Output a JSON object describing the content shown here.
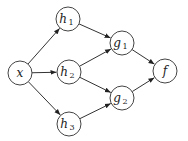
{
  "diagram": {
    "type": "directed-graph",
    "nodes": [
      {
        "id": "x",
        "label": "x",
        "sub": "",
        "cx": 20,
        "cy": 73
      },
      {
        "id": "h1",
        "label": "h",
        "sub": "1",
        "cx": 68,
        "cy": 19
      },
      {
        "id": "h2",
        "label": "h",
        "sub": "2",
        "cx": 69,
        "cy": 72
      },
      {
        "id": "h3",
        "label": "h",
        "sub": "3",
        "cx": 69,
        "cy": 124
      },
      {
        "id": "g1",
        "label": "g",
        "sub": "1",
        "cx": 122,
        "cy": 43
      },
      {
        "id": "g2",
        "label": "g",
        "sub": "2",
        "cx": 122,
        "cy": 98
      },
      {
        "id": "f",
        "label": "f",
        "sub": "",
        "cx": 165,
        "cy": 71
      }
    ],
    "edges": [
      {
        "from": "x",
        "to": "h1"
      },
      {
        "from": "x",
        "to": "h2"
      },
      {
        "from": "x",
        "to": "h3"
      },
      {
        "from": "h1",
        "to": "g1"
      },
      {
        "from": "h2",
        "to": "g1"
      },
      {
        "from": "h2",
        "to": "g2"
      },
      {
        "from": "h3",
        "to": "g2"
      },
      {
        "from": "g1",
        "to": "f"
      },
      {
        "from": "g2",
        "to": "f"
      }
    ],
    "node_radius": 12,
    "colors": {
      "stroke": "#444444",
      "edge": "#333333",
      "fill": "#ffffff",
      "text": "#222222"
    }
  }
}
